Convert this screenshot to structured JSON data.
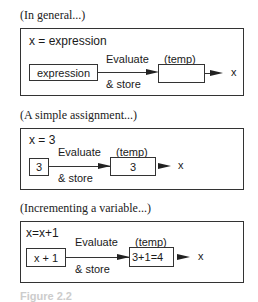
{
  "panels": [
    {
      "caption": "(In general...)",
      "statement": "x = expression",
      "source": "expression",
      "action_top": "Evaluate",
      "action_bottom": "& store",
      "temp_label": "(temp)",
      "temp_value": "",
      "target": "x"
    },
    {
      "caption": "(A simple assignment...)",
      "statement": "x = 3",
      "source": "3",
      "action_top": "Evaluate",
      "action_bottom": "& store",
      "temp_label": "(temp)",
      "temp_value": "3",
      "target": "x"
    },
    {
      "caption": "(Incrementing a variable...)",
      "statement": "x=x+1",
      "source": "x + 1",
      "action_top": "Evaluate",
      "action_bottom": "& store",
      "temp_label": "(temp)",
      "temp_value": "3+1=4",
      "target": "x"
    }
  ],
  "figure_caption": "Figure 2.2"
}
